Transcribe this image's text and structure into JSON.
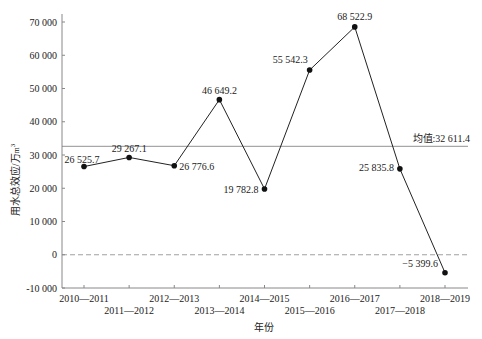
{
  "chart_data": {
    "type": "line",
    "title": "",
    "xlabel": "年份",
    "ylabel": "用水总效应/万m³",
    "ylabel_main": "用水总效应/万",
    "ylabel_unit": "m",
    "ylabel_sup": "3",
    "ylim": [
      -10000,
      70000
    ],
    "yticks": [
      -10000,
      0,
      10000,
      20000,
      30000,
      40000,
      50000,
      60000,
      70000
    ],
    "ytick_labels": [
      "-10 000",
      "0",
      "10 000",
      "20 000",
      "30 000",
      "40 000",
      "50 000",
      "60 000",
      "70 000"
    ],
    "categories": [
      "2010—2011",
      "2011—2012",
      "2012—2013",
      "2013—2014",
      "2014—2015",
      "2015—2016",
      "2016—2017",
      "2017—2018",
      "2018—2019"
    ],
    "values": [
      26525.7,
      29267.1,
      26776.6,
      46649.2,
      19782.8,
      55542.3,
      68522.9,
      25835.8,
      -5399.6
    ],
    "value_labels": [
      "26 525.7",
      "29 267.1",
      "26 776.6",
      "46 649.2",
      "19 782.8",
      "55 542.3",
      "68 522.9",
      "25 835.8",
      "−5 399.6"
    ],
    "mean": 32611.4,
    "mean_label": "均值:32 611.4",
    "zero_line": "dashed",
    "grid": false,
    "legend": null,
    "colors": {
      "line": "#222222",
      "marker": "#111111",
      "mean_line": "#777777",
      "axis": "#888888"
    }
  }
}
